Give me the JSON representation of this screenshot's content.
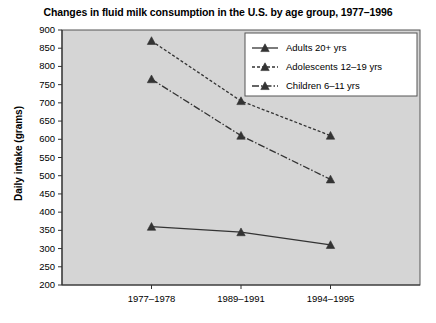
{
  "chart_data": {
    "type": "line",
    "title": "Changes in fluid milk consumption in the U.S. by age group, 1977–1996",
    "xlabel": "",
    "ylabel": "Daily intake (grams)",
    "categories": [
      "1977–1978",
      "1989–1991",
      "1994–1995"
    ],
    "ylim": [
      200,
      900
    ],
    "yticks": [
      200,
      250,
      300,
      350,
      400,
      450,
      500,
      550,
      600,
      650,
      700,
      750,
      800,
      850,
      900
    ],
    "ytick_labels": [
      "200",
      "250",
      "300",
      "350",
      "400",
      "450",
      "500",
      "550",
      "600",
      "650",
      "700",
      "750",
      "800",
      "850",
      "900"
    ],
    "grid": false,
    "legend_position": "upper right",
    "series": [
      {
        "name": "Adults 20+ yrs",
        "values": [
          360,
          345,
          310
        ],
        "line_style": "solid",
        "marker": "triangle",
        "color": "#333333"
      },
      {
        "name": "Adolescents 12–19 yrs",
        "values": [
          870,
          705,
          610
        ],
        "line_style": "dashed",
        "marker": "triangle",
        "color": "#333333"
      },
      {
        "name": "Children 6–11 yrs",
        "values": [
          765,
          610,
          490
        ],
        "line_style": "dashdot",
        "marker": "triangle",
        "color": "#333333"
      }
    ]
  },
  "legend": {
    "entries": [
      {
        "label": "Adults 20+ yrs"
      },
      {
        "label": "Adolescents 12–19 yrs"
      },
      {
        "label": "Children 6–11 yrs"
      }
    ]
  },
  "colors": {
    "plot_background": "#d5d5d5",
    "plot_border": "#555555",
    "legend_background": "#ffffff",
    "legend_border": "#555555",
    "line": "#333333",
    "text": "#000000",
    "page_background": "#ffffff"
  }
}
